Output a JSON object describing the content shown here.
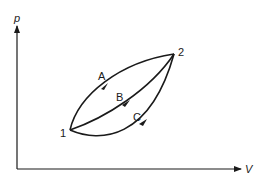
{
  "diagram": {
    "type": "pV-diagram",
    "axes": {
      "y_label": "p",
      "x_label": "V"
    },
    "states": [
      {
        "id": "1",
        "label": "1"
      },
      {
        "id": "2",
        "label": "2"
      }
    ],
    "paths": [
      {
        "id": "A",
        "label": "A",
        "from": "1",
        "to": "2",
        "shape": "upper-convex-curve"
      },
      {
        "id": "B",
        "label": "B",
        "from": "1",
        "to": "2",
        "shape": "middle-curve"
      },
      {
        "id": "C",
        "label": "C",
        "from": "1",
        "to": "2",
        "shape": "lower-concave-curve"
      }
    ],
    "colors": {
      "line": "#1a1a1a",
      "background": "#ffffff"
    }
  }
}
